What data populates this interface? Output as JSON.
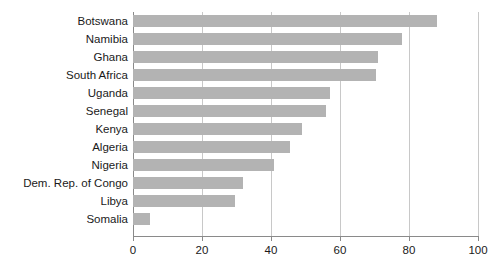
{
  "chart_data": {
    "type": "bar",
    "orientation": "horizontal",
    "title": "",
    "subtitle": "",
    "xlabel": "",
    "ylabel": "",
    "xlim": [
      0,
      100
    ],
    "xticks": [
      0,
      20,
      40,
      60,
      80,
      100
    ],
    "xtick_labels": [
      "0",
      "20",
      "40",
      "60",
      "80",
      "100"
    ],
    "grid": true,
    "grid_axis": "x",
    "legend": false,
    "legend_position": "none",
    "bar_color": "#b3b3b3",
    "grid_color": "#c8c8c8",
    "axis_color": "#8a8a8a",
    "text_color": "#1a1a1a",
    "background_color": "#ffffff",
    "categories": [
      "Botswana",
      "Namibia",
      "Ghana",
      "South Africa",
      "Uganda",
      "Senegal",
      "Kenya",
      "Algeria",
      "Nigeria",
      "Dem. Rep. of Congo",
      "Libya",
      "Somalia"
    ],
    "values": [
      88,
      78,
      71,
      70.5,
      57,
      56,
      49,
      45.5,
      41,
      32,
      29.5,
      5
    ]
  }
}
